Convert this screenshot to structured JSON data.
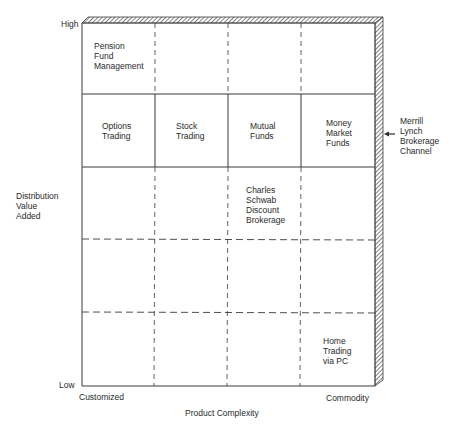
{
  "diagram": {
    "type": "matrix",
    "y_axis": {
      "title": "Distribution\nValue\nAdded",
      "high_label": "High",
      "low_label": "Low"
    },
    "x_axis": {
      "title": "Product Complexity",
      "left_label": "Customized",
      "right_label": "Commodity"
    },
    "grid": {
      "columns": 4,
      "rows": 5,
      "solid_row_lines": [
        1,
        2
      ],
      "dashed_row_lines": [
        3,
        4
      ],
      "column_lines_style": "dashed-in-rows-1-3-4-5-solid-in-row-2"
    },
    "cells": [
      {
        "row": 1,
        "col": 1,
        "text": "Pension\nFund\nManagement"
      },
      {
        "row": 2,
        "col": 1,
        "text": "Options\nTrading"
      },
      {
        "row": 2,
        "col": 2,
        "text": "Stock\nTrading"
      },
      {
        "row": 2,
        "col": 3,
        "text": "Mutual\nFunds"
      },
      {
        "row": 2,
        "col": 4,
        "text": "Money\nMarket\nFunds"
      },
      {
        "row": 3,
        "col": 3,
        "text": "Charles\nSchwab\nDiscount\nBrokerage"
      },
      {
        "row": 5,
        "col": 4,
        "text": "Home\nTrading\nvia PC"
      }
    ],
    "callout": {
      "text": "Merrill\nLynch\nBrokerage\nChannel",
      "points_to": "hatched-border"
    },
    "colors": {
      "line": "#3a3a3a",
      "hatch": "#555555",
      "background": "#ffffff"
    }
  }
}
